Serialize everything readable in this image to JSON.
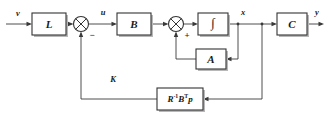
{
  "diagram": {
    "type": "control-block-diagram",
    "background_color": "#ffffff",
    "line_color": "#3a3a3a",
    "block_stroke_color": "#333333",
    "block_fill_color": "#ffffff",
    "shadow_color": "#b8b8b8",
    "blocks": [
      {
        "id": "L",
        "label": "L",
        "x": 32,
        "y": 13,
        "w": 34,
        "h": 22
      },
      {
        "id": "B",
        "label": "B",
        "x": 117,
        "y": 13,
        "w": 34,
        "h": 22
      },
      {
        "id": "INT",
        "label": "∫",
        "x": 198,
        "y": 13,
        "w": 30,
        "h": 22
      },
      {
        "id": "C",
        "label": "C",
        "x": 277,
        "y": 13,
        "w": 30,
        "h": 22
      },
      {
        "id": "A",
        "label": "A",
        "x": 196,
        "y": 49,
        "w": 30,
        "h": 20
      },
      {
        "id": "K",
        "label": "R⁻¹Bᵀp",
        "x": 157,
        "y": 88,
        "w": 46,
        "h": 22
      }
    ],
    "sum_junctions": [
      {
        "id": "sum1",
        "cx": 81,
        "cy": 24,
        "r": 7.5,
        "sign": "−",
        "sign_x": 92,
        "sign_y": 36
      },
      {
        "id": "sum2",
        "cx": 176,
        "cy": 24,
        "r": 7.5,
        "sign": "+",
        "sign_x": 187,
        "sign_y": 36
      }
    ],
    "signals": [
      {
        "id": "v",
        "label": "v",
        "x": 18,
        "y": 14
      },
      {
        "id": "u",
        "label": "u",
        "x": 103,
        "y": 13
      },
      {
        "id": "x",
        "label": "x",
        "x": 243,
        "y": 13
      },
      {
        "id": "y",
        "label": "y",
        "x": 317,
        "y": 13
      },
      {
        "id": "K",
        "label": "K",
        "x": 113,
        "y": 80
      }
    ],
    "k_block_text": {
      "base_r": "R",
      "exp_r": "-1",
      "base_b": "B",
      "exp_b": "T",
      "base_p": "p"
    }
  }
}
